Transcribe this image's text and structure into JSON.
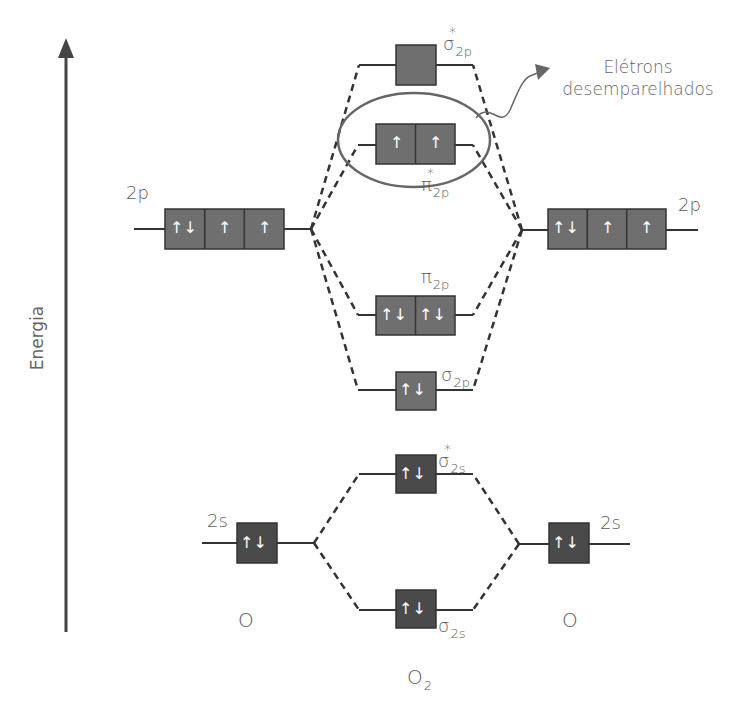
{
  "axis": {
    "label": "Energia",
    "direction": "up"
  },
  "left_atom": {
    "label": "O",
    "orbitals": [
      {
        "name": "2s",
        "electrons": [
          "↑↓"
        ]
      },
      {
        "name": "2p",
        "electrons": [
          "↑↓",
          "↑",
          "↑"
        ]
      }
    ]
  },
  "right_atom": {
    "label": "O",
    "orbitals": [
      {
        "name": "2s",
        "electrons": [
          "↑↓"
        ]
      },
      {
        "name": "2p",
        "electrons": [
          "↑↓",
          "↑",
          "↑"
        ]
      }
    ]
  },
  "molecule": {
    "label": "O",
    "label_sub": "2",
    "orbitals": [
      {
        "id": "sigma2p_star",
        "symbol": "σ",
        "sub": "2p",
        "star": "*",
        "electrons": [
          ""
        ]
      },
      {
        "id": "pi2p_star",
        "symbol": "π",
        "sub": "2p",
        "star": "*",
        "electrons": [
          "↑",
          "↑"
        ]
      },
      {
        "id": "pi2p",
        "symbol": "π",
        "sub": "2p",
        "star": "",
        "electrons": [
          "↑↓",
          "↑↓"
        ]
      },
      {
        "id": "sigma2p",
        "symbol": "σ",
        "sub": "2p",
        "star": "",
        "electrons": [
          "↑↓"
        ]
      },
      {
        "id": "sigma2s_star",
        "symbol": "σ",
        "sub": "2s",
        "star": "*",
        "electrons": [
          "↑↓"
        ]
      },
      {
        "id": "sigma2s",
        "symbol": "σ",
        "sub": "2s",
        "star": "",
        "electrons": [
          "↑↓"
        ]
      }
    ]
  },
  "annotation": {
    "line1": "Elétrons",
    "line2": "desemparelhados"
  },
  "colors": {
    "box_2p": "#6f6f6f",
    "box_2s": "#4a4a4a",
    "line": "#333333",
    "ellipse": "#666666",
    "text": "#5a5a5a"
  }
}
